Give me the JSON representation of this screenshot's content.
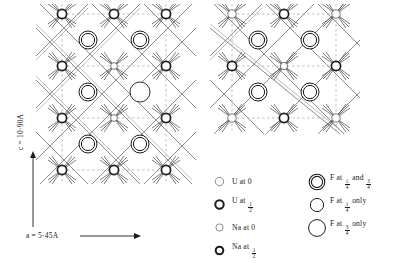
{
  "figure": {
    "axes": {
      "horizontal_label": "a = 5·45A",
      "vertical_label": "c = 10·90A",
      "a_value": "5·45",
      "c_value": "10·90",
      "unit": "A"
    },
    "panels": [
      {
        "name": "left-projection",
        "columns": 4,
        "rows": 7
      },
      {
        "name": "right-projection",
        "columns": 4,
        "rows": 4
      }
    ]
  },
  "legend": {
    "left_column": [
      {
        "symbol": "thin-circle-small",
        "atom": "U",
        "prefix": "U at",
        "height": "0",
        "fraction": null
      },
      {
        "symbol": "thick-circle-small",
        "atom": "U",
        "prefix": "U at",
        "height": "½",
        "fraction": {
          "num": "1",
          "den": "2"
        }
      },
      {
        "symbol": "thin-circle-tiny",
        "atom": "Na",
        "prefix": "Na at",
        "height": "0",
        "fraction": null
      },
      {
        "symbol": "thick-circle-tiny",
        "atom": "Na",
        "prefix": "Na at",
        "height": "½",
        "fraction": {
          "num": "1",
          "den": "2"
        }
      }
    ],
    "right_column": [
      {
        "symbol": "double-circle",
        "atom": "F",
        "prefix": "F at",
        "suffix_a": "and",
        "suffix_b": "only",
        "fraction1": {
          "num": "1",
          "den": "4"
        },
        "fraction2": {
          "num": "3",
          "den": "4"
        },
        "mode": "and"
      },
      {
        "symbol": "medium-circle",
        "atom": "F",
        "prefix": "F at",
        "suffix_b": "only",
        "fraction1": {
          "num": "1",
          "den": "4"
        },
        "mode": "only"
      },
      {
        "symbol": "large-circle",
        "atom": "F",
        "prefix": "F at",
        "suffix_b": "only",
        "fraction1": {
          "num": "3",
          "den": "4"
        },
        "mode": "only"
      }
    ]
  },
  "colors": {
    "ink": "#1a1a1a",
    "bond": "#555555",
    "dashed": "#9a9a9a",
    "background": "#ffffff"
  }
}
